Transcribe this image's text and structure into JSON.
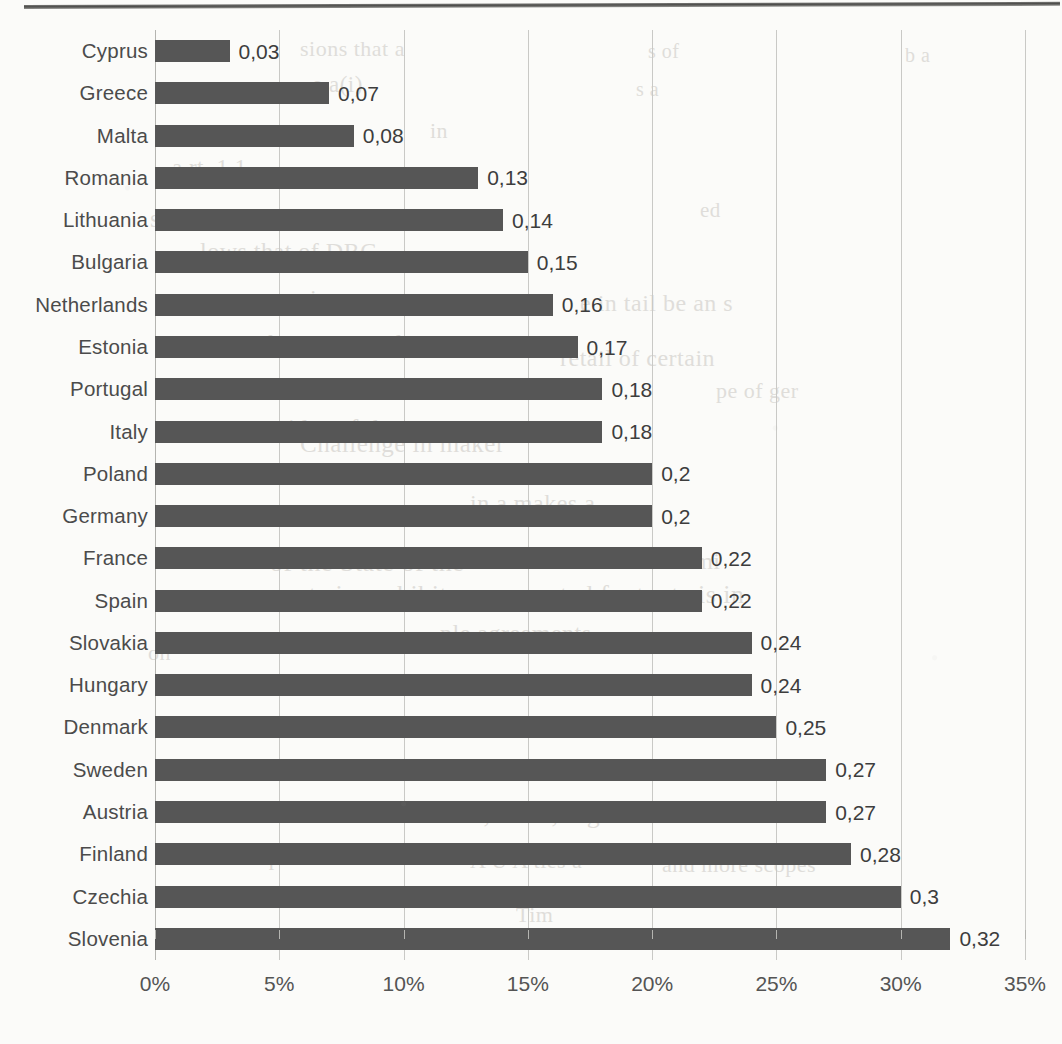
{
  "chart_data": {
    "type": "bar",
    "orientation": "horizontal",
    "title": "",
    "xlabel": "",
    "ylabel": "",
    "xlim": [
      0,
      0.35
    ],
    "xticks": [
      "0%",
      "5%",
      "10%",
      "15%",
      "20%",
      "25%",
      "30%",
      "35%"
    ],
    "xtick_values": [
      0,
      0.05,
      0.1,
      0.15,
      0.2,
      0.25,
      0.3,
      0.35
    ],
    "grid": true,
    "legend": null,
    "decimal_separator": ",",
    "bar_color": "#565656",
    "categories": [
      "Cyprus",
      "Greece",
      "Malta",
      "Romania",
      "Lithuania",
      "Bulgaria",
      "Netherlands",
      "Estonia",
      "Portugal",
      "Italy",
      "Poland",
      "Germany",
      "France",
      "Spain",
      "Slovakia",
      "Hungary",
      "Denmark",
      "Sweden",
      "Austria",
      "Finland",
      "Czechia",
      "Slovenia"
    ],
    "values": [
      0.03,
      0.07,
      0.08,
      0.13,
      0.14,
      0.15,
      0.16,
      0.17,
      0.18,
      0.18,
      0.2,
      0.2,
      0.22,
      0.22,
      0.24,
      0.24,
      0.25,
      0.27,
      0.27,
      0.28,
      0.3,
      0.32
    ],
    "data_labels": [
      "0,03",
      "0,07",
      "0,08",
      "0,13",
      "0,14",
      "0,15",
      "0,16",
      "0,17",
      "0,18",
      "0,18",
      "0,2",
      "0,2",
      "0,22",
      "0,22",
      "0,24",
      "0,24",
      "0,25",
      "0,27",
      "0,27",
      "0,28",
      "0,3",
      "0,32"
    ]
  },
  "page": {
    "background_color": "#fbfbf9",
    "bleed_through_lines": [
      {
        "text": "sions that a",
        "x": 300,
        "y": 36,
        "size": 22
      },
      {
        "text": "s of",
        "x": 648,
        "y": 40,
        "size": 20
      },
      {
        "text": "b a",
        "x": 905,
        "y": 44,
        "size": 20
      },
      {
        "text": "e a(i)",
        "x": 312,
        "y": 72,
        "size": 23
      },
      {
        "text": "s a",
        "x": 636,
        "y": 78,
        "size": 20
      },
      {
        "text": "in",
        "x": 430,
        "y": 118,
        "size": 22
      },
      {
        "text": "a rt. 1 1",
        "x": 172,
        "y": 155,
        "size": 23
      },
      {
        "text": "s F a wa s the that",
        "x": 150,
        "y": 205,
        "size": 25
      },
      {
        "text": "lows that of DRC",
        "x": 200,
        "y": 238,
        "size": 24
      },
      {
        "text": "ed",
        "x": 700,
        "y": 198,
        "size": 21
      },
      {
        "text": "in a serve an",
        "x": 310,
        "y": 285,
        "size": 24
      },
      {
        "text": "e in tail be an s",
        "x": 580,
        "y": 290,
        "size": 24
      },
      {
        "text": "s for a oms and its",
        "x": 248,
        "y": 330,
        "size": 24
      },
      {
        "text": "retail of certain",
        "x": 560,
        "y": 345,
        "size": 24
      },
      {
        "text": "pe of ger",
        "x": 716,
        "y": 378,
        "size": 22
      },
      {
        "text": "n sides of the m",
        "x": 258,
        "y": 415,
        "size": 25
      },
      {
        "text": "Challenge in maker",
        "x": 300,
        "y": 430,
        "size": 25
      },
      {
        "text": "that the state one",
        "x": 300,
        "y": 462,
        "size": 25
      },
      {
        "text": "in a makes a",
        "x": 470,
        "y": 490,
        "size": 24
      },
      {
        "text": "of the State of the",
        "x": 270,
        "y": 548,
        "size": 26
      },
      {
        "text": "of a semi",
        "x": 628,
        "y": 548,
        "size": 24
      },
      {
        "text": "mate is prohibit",
        "x": 276,
        "y": 580,
        "size": 26
      },
      {
        "text": "ted footnote is in",
        "x": 560,
        "y": 580,
        "size": 26
      },
      {
        "text": "ple agreements",
        "x": 440,
        "y": 620,
        "size": 24
      },
      {
        "text": "on",
        "x": 148,
        "y": 640,
        "size": 22
      },
      {
        "text": "0,25 17, big",
        "x": 470,
        "y": 800,
        "size": 26
      },
      {
        "text": "title the depth",
        "x": 170,
        "y": 845,
        "size": 22
      },
      {
        "text": "A U A ties a",
        "x": 470,
        "y": 848,
        "size": 22
      },
      {
        "text": "and more scopes",
        "x": 662,
        "y": 852,
        "size": 22
      },
      {
        "text": "Tim",
        "x": 516,
        "y": 902,
        "size": 22
      }
    ]
  }
}
